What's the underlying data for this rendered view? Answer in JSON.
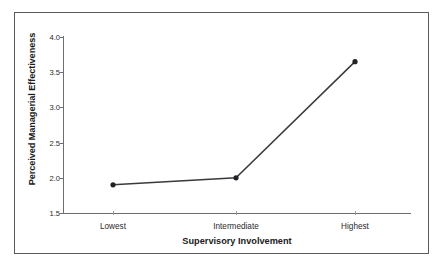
{
  "chart_data": {
    "type": "line",
    "title": "",
    "xlabel": "Supervisory Involvement",
    "ylabel": "Perceived Managerial Effectiveness",
    "categories": [
      "Lowest",
      "Intermediate",
      "Highest"
    ],
    "values": [
      1.9,
      2.0,
      3.65
    ],
    "series": [
      {
        "name": "Perceived Managerial Effectiveness",
        "values": [
          1.9,
          2.0,
          3.65
        ]
      }
    ],
    "ylim": [
      1.5,
      4.0
    ],
    "yticks": [
      "1.5",
      "2.0",
      "2.5",
      "3.0",
      "3.5",
      "4.0"
    ],
    "ytick_values": [
      1.5,
      2.0,
      2.5,
      3.0,
      3.5,
      4.0
    ],
    "grid": false,
    "legend": false,
    "legend_position": "none",
    "marker": "filled-circle",
    "line_color": "#3a3a3e",
    "marker_color": "#222226",
    "axis_color": "#6e6e72",
    "frame_color": "#5a5a5e",
    "background_color": "#ffffff"
  },
  "figure": {
    "xlabel": "Supervisory Involvement",
    "ylabel": "Perceived Managerial Effectiveness",
    "ytick_labels": [
      "4.0",
      "3.5",
      "3.0",
      "2.5",
      "2.0",
      "1.5"
    ],
    "xtick_labels": [
      "Lowest",
      "Intermediate",
      "Highest"
    ]
  }
}
